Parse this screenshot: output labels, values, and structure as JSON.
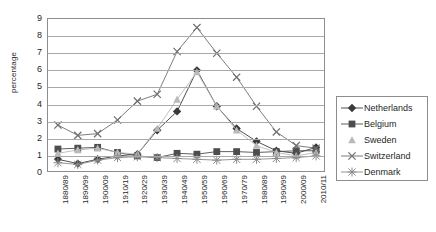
{
  "chart_data": {
    "type": "line",
    "title": "",
    "xlabel": "",
    "ylabel": "percentage",
    "ylim": [
      0,
      9
    ],
    "yticks": [
      0,
      1,
      2,
      3,
      4,
      5,
      6,
      7,
      8,
      9
    ],
    "grid": true,
    "legend_position": "right",
    "categories": [
      "1880/89",
      "1890/99",
      "1900/09",
      "1910/19",
      "1920/29",
      "1930/39",
      "1940/49",
      "1950/59",
      "1960/69",
      "1970/79",
      "1980/89",
      "1990/99",
      "2000/09",
      "2010/11"
    ],
    "series": [
      {
        "name": "Netherlands",
        "marker": "diamond",
        "color": "#3a3a3a",
        "values": [
          0.8,
          0.55,
          0.8,
          1.0,
          1.1,
          2.5,
          3.6,
          6.0,
          3.9,
          2.6,
          1.85,
          1.3,
          1.15,
          1.5
        ]
      },
      {
        "name": "Belgium",
        "marker": "square",
        "color": "#4d4d4d",
        "values": [
          1.4,
          1.45,
          1.5,
          1.2,
          1.0,
          0.9,
          1.15,
          1.1,
          1.25,
          1.25,
          1.2,
          1.25,
          1.3,
          1.3
        ]
      },
      {
        "name": "Sweden",
        "marker": "triangle",
        "color": "#b9b9b9",
        "values": [
          1.15,
          1.35,
          1.45,
          1.2,
          1.1,
          2.6,
          4.3,
          5.9,
          3.9,
          2.5,
          1.6,
          1.2,
          1.0,
          1.2
        ]
      },
      {
        "name": "Switzerland",
        "marker": "cross",
        "color": "#6e6e6e",
        "values": [
          2.8,
          2.2,
          2.3,
          3.1,
          4.2,
          4.6,
          7.1,
          8.5,
          7.0,
          5.6,
          3.9,
          2.4,
          1.6,
          1.45
        ]
      },
      {
        "name": "Denmark",
        "marker": "asterisk",
        "color": "#8a8a8a",
        "values": [
          0.6,
          0.5,
          0.75,
          0.9,
          0.95,
          0.9,
          0.85,
          0.8,
          0.75,
          0.8,
          0.8,
          0.85,
          0.9,
          1.0
        ]
      }
    ]
  }
}
